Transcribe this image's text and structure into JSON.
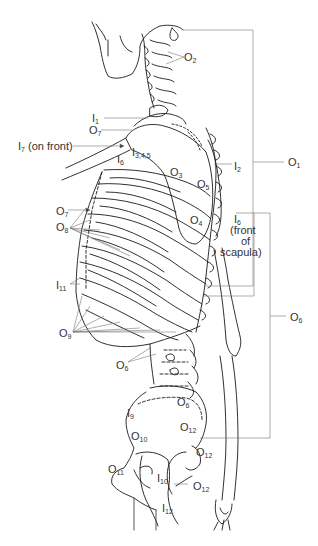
{
  "diagram": {
    "labels": [
      {
        "id": "O2",
        "letter": "O",
        "sub": "2",
        "x": 188,
        "y": 54
      },
      {
        "id": "I1",
        "letter": "I",
        "sub": "1",
        "x": 92,
        "y": 112
      },
      {
        "id": "O7a",
        "letter": "O",
        "sub": "7",
        "x": 89,
        "y": 123
      },
      {
        "id": "I7",
        "letter": "I",
        "sub": "7",
        "suffix": " (on front)",
        "x": 18,
        "y": 142
      },
      {
        "id": "I345",
        "letter": "I",
        "sub": "3,4,5",
        "x": 132,
        "y": 148
      },
      {
        "id": "I6a",
        "letter": "I",
        "sub": "6",
        "x": 117,
        "y": 152
      },
      {
        "id": "I2",
        "letter": "I",
        "sub": "2",
        "x": 234,
        "y": 162
      },
      {
        "id": "O1",
        "letter": "O",
        "sub": "1",
        "x": 288,
        "y": 160
      },
      {
        "id": "O3",
        "letter": "O",
        "sub": "3",
        "x": 170,
        "y": 168
      },
      {
        "id": "O5",
        "letter": "O",
        "sub": "5",
        "x": 197,
        "y": 180
      },
      {
        "id": "O7b",
        "letter": "O",
        "sub": "7",
        "x": 56,
        "y": 207
      },
      {
        "id": "O4",
        "letter": "O",
        "sub": "4",
        "x": 190,
        "y": 215
      },
      {
        "id": "I6b",
        "letter": "I",
        "sub": "6",
        "suffix": "",
        "x": 234,
        "y": 215
      },
      {
        "id": "front_of_scapula_1",
        "text": "(front",
        "x": 230,
        "y": 226
      },
      {
        "id": "front_of_scapula_2",
        "text": "of",
        "x": 241,
        "y": 237
      },
      {
        "id": "front_of_scapula_3",
        "text": "scapula)",
        "x": 220,
        "y": 248
      },
      {
        "id": "O8",
        "letter": "O",
        "sub": "8",
        "x": 56,
        "y": 223
      },
      {
        "id": "I11",
        "letter": "I",
        "sub": "11",
        "x": 56,
        "y": 281
      },
      {
        "id": "O6a",
        "letter": "O",
        "sub": "6",
        "x": 290,
        "y": 313
      },
      {
        "id": "O9",
        "letter": "O",
        "sub": "9",
        "x": 59,
        "y": 330
      },
      {
        "id": "O6b",
        "letter": "O",
        "sub": "6",
        "x": 116,
        "y": 361
      },
      {
        "id": "O6c",
        "letter": "O",
        "sub": "6",
        "x": 177,
        "y": 397
      },
      {
        "id": "I9",
        "letter": "I",
        "sub": "9",
        "x": 127,
        "y": 409
      },
      {
        "id": "O12a",
        "letter": "O",
        "sub": "12",
        "x": 180,
        "y": 423
      },
      {
        "id": "O10",
        "letter": "O",
        "sub": "10",
        "x": 131,
        "y": 432
      },
      {
        "id": "O12b",
        "letter": "O",
        "sub": "12",
        "x": 196,
        "y": 446
      },
      {
        "id": "O11",
        "letter": "O",
        "sub": "11",
        "x": 108,
        "y": 463
      },
      {
        "id": "I10",
        "letter": "I",
        "sub": "10",
        "x": 157,
        "y": 474
      },
      {
        "id": "O12c",
        "letter": "O",
        "sub": "12",
        "x": 193,
        "y": 482
      },
      {
        "id": "I12",
        "letter": "I",
        "sub": "12",
        "x": 162,
        "y": 503
      }
    ]
  }
}
